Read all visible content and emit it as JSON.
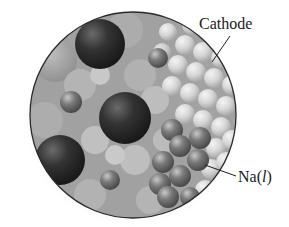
{
  "figure": {
    "labels": {
      "cathode": "Cathode",
      "sodium_symbol": "Na(",
      "sodium_phase": "l",
      "sodium_close": ")"
    },
    "colors": {
      "outline": "#2a2a2a",
      "background_fill": "#9a9a9a",
      "large_ion": "#2b2b2b",
      "sodium_atom": "#6e6e6e",
      "cathode_atom": "#d2d2d2",
      "label_text": "#1a1a1a"
    }
  }
}
